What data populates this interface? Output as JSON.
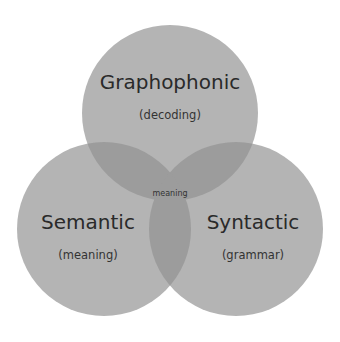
{
  "diagram": {
    "type": "venn",
    "circles": [
      {
        "id": "graphophonic",
        "title": "Graphophonic",
        "subtitle": "(decoding)"
      },
      {
        "id": "semantic",
        "title": "Semantic",
        "subtitle": "(meaning)"
      },
      {
        "id": "syntactic",
        "title": "Syntactic",
        "subtitle": "(grammar)"
      }
    ],
    "center_label": "meaning",
    "colors": {
      "circle_fill": "#b4b4b4",
      "overlap_fill": "#9c9c9c",
      "text": "#2a2a2a",
      "background": "#ffffff"
    }
  }
}
